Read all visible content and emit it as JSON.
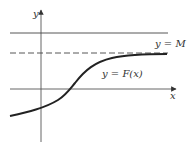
{
  "diagram": {
    "type": "function-graph",
    "axes": {
      "x_label": "x",
      "y_label": "y"
    },
    "lines": [
      {
        "name": "upper-bound",
        "label": "y = M",
        "style": "solid"
      },
      {
        "name": "asymptote",
        "label": "",
        "style": "dashed"
      }
    ],
    "curve": {
      "label": "y = F(x)",
      "shape": "sigmoid"
    },
    "colors": {
      "axis": "#555555",
      "curve": "#222222",
      "line": "#444444"
    }
  }
}
